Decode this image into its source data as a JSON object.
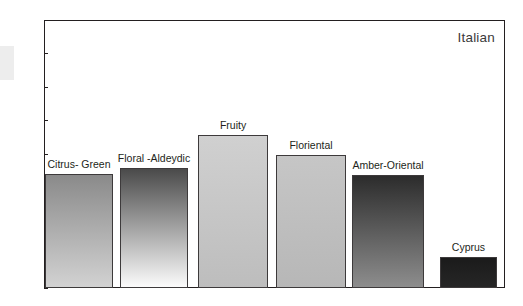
{
  "chart_data": {
    "type": "bar",
    "title": "",
    "annotation": "Italian",
    "xlabel": "",
    "ylabel": "",
    "ylim": [
      0,
      40
    ],
    "yticks": [
      0,
      5,
      10,
      15,
      20,
      25,
      30,
      35,
      40
    ],
    "ytick_labels": [
      "0",
      "5",
      "10",
      "15",
      "20",
      "25",
      "30",
      "35",
      "40"
    ],
    "grid": false,
    "legend": "none",
    "categories": [
      "Citrus- Green",
      "Floral -Aldeydic",
      "Fruity",
      "Floriental",
      "Amber-Oriental",
      "Cyprus"
    ],
    "values": [
      17.0,
      17.9,
      22.8,
      19.8,
      16.8,
      4.6
    ],
    "bars": [
      {
        "label": "Citrus- Green",
        "value": 17.0,
        "gradient_top": "#8a8a8a",
        "gradient_bottom": "#d2d2d2",
        "border": "#3d3a3b"
      },
      {
        "label": "Floral -Aldeydic",
        "value": 17.9,
        "gradient_top": "#4a4a4a",
        "gradient_bottom": "#fbfbfb",
        "border": "#3d3a3b"
      },
      {
        "label": "Fruity",
        "value": 22.8,
        "gradient_top": "#d0d0d0",
        "gradient_bottom": "#bdbdbd",
        "border": "#3d3a3b"
      },
      {
        "label": "Floriental",
        "value": 19.8,
        "gradient_top": "#c6c6c6",
        "gradient_bottom": "#b7b7b7",
        "border": "#3d3a3b"
      },
      {
        "label": "Amber-Oriental",
        "value": 16.8,
        "gradient_top": "#2c2c2c",
        "gradient_bottom": "#8d8d8d",
        "border": "#3d3a3b"
      },
      {
        "label": "Cyprus",
        "value": 4.6,
        "gradient_top": "#1b1b1b",
        "gradient_bottom": "#262626",
        "border": "#3d3a3b"
      }
    ],
    "axis_color": "#231f20",
    "text_color": "#231f20",
    "annotation_color": "#3b3b3b",
    "background": "#ffffff"
  }
}
